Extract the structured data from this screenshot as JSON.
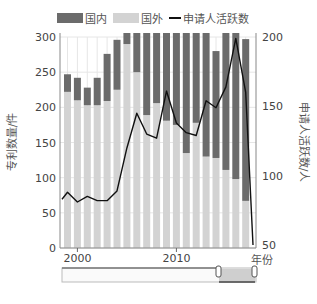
{
  "legend": {
    "domestic": "国内",
    "foreign": "国外",
    "applicants": "申请人活跃数"
  },
  "axes": {
    "left_label": "专利数量/件",
    "right_label": "申请人活跃数/人",
    "x_label": "年份"
  },
  "colors": {
    "domestic": "#6b6b6b",
    "foreign": "#d3d3d3",
    "line": "#111111",
    "grid": "#e6e6e6"
  },
  "chart_data": {
    "type": "bar",
    "stacked": true,
    "title": "",
    "xlabel": "年份",
    "ylabel": "专利数量/件",
    "y2label": "申请人活跃数/人",
    "ylim": [
      0,
      300
    ],
    "y2lim": [
      50,
      200
    ],
    "yticks": [
      0,
      50,
      100,
      150,
      200,
      250,
      300
    ],
    "y2ticks": [
      50,
      100,
      150,
      200
    ],
    "xticks": [
      "2000",
      "2010"
    ],
    "grid": true,
    "legend_position": "top",
    "categories": [
      "1999",
      "2000",
      "2001",
      "2002",
      "2003",
      "2004",
      "2005",
      "2006",
      "2007",
      "2008",
      "2009",
      "2010",
      "2011",
      "2012",
      "2013",
      "2014",
      "2015",
      "2016",
      "2017"
    ],
    "series": [
      {
        "name": "国外",
        "type": "bar",
        "axis": "left",
        "values": [
          222,
          210,
          203,
          203,
          209,
          225,
          290,
          250,
          189,
          206,
          181,
          175,
          135,
          178,
          130,
          128,
          111,
          98,
          67
        ]
      },
      {
        "name": "国内",
        "type": "bar",
        "axis": "left",
        "values": [
          25,
          32,
          25,
          39,
          67,
          71,
          60,
          95,
          140,
          120,
          150,
          160,
          190,
          150,
          200,
          152,
          205,
          220,
          230
        ]
      },
      {
        "name": "申请人活跃数",
        "type": "line",
        "axis": "right",
        "values": [
          88,
          81,
          85,
          82,
          82,
          89,
          120,
          145,
          130,
          127,
          161,
          138,
          131,
          129,
          154,
          149,
          164,
          199,
          160
        ]
      }
    ],
    "line_tail": {
      "x_end": "2017.7",
      "value": 50
    },
    "range_slider": {
      "start": "2014",
      "end": "2018"
    }
  }
}
